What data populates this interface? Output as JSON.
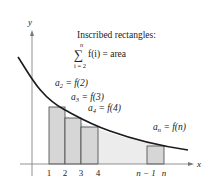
{
  "diagram": {
    "axes": {
      "x_label": "x",
      "y_label": "y"
    },
    "title_line1": "Inscribed rectangles:",
    "sum_top": "n",
    "sum_symbol": "∑",
    "sum_expr": "f(i) = area",
    "sum_bottom": "i = 2",
    "labels": {
      "a2": "a",
      "a2_sub": "2",
      "a2_rhs": " = f(2)",
      "a3": "a",
      "a3_sub": "3",
      "a3_rhs": " = f(3)",
      "a4": "a",
      "a4_sub": "4",
      "a4_rhs": " = f(4)",
      "an": "a",
      "an_sub": "n",
      "an_rhs": " = f(n)"
    },
    "ticks": [
      "1",
      "2",
      "3",
      "4",
      "n − 1",
      "n"
    ],
    "colors": {
      "curve": "#1a1a1a",
      "fill": "#e8e8e8",
      "rect": "#d4d4d4",
      "axis": "#777777"
    }
  }
}
